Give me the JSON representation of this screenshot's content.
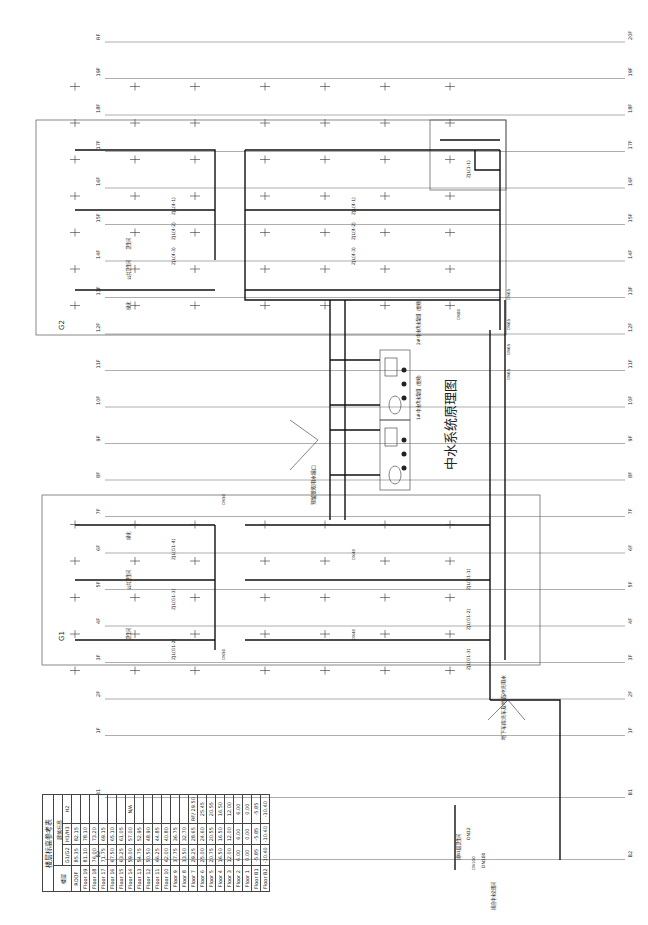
{
  "drawing": {
    "title": "中水系统原理图",
    "orientation": "rotated 90° (sheet drawn sideways)"
  },
  "floors_left": [
    "RF",
    "19F",
    "18F",
    "17F",
    "16F",
    "15F",
    "14F",
    "13F",
    "12F",
    "11F",
    "10F",
    "9F",
    "8F",
    "7F",
    "6F",
    "5F",
    "4F",
    "3F",
    "2F",
    "1F",
    "B1",
    "B2"
  ],
  "floors_right": [
    "20F",
    "19F",
    "18F",
    "17F",
    "16F",
    "15F",
    "14F",
    "13F",
    "12F",
    "11F",
    "10F",
    "9F",
    "8F",
    "7F",
    "6F",
    "5F",
    "4F",
    "3F",
    "2F",
    "1F",
    "B1",
    "B2"
  ],
  "zones": {
    "g1": "G1",
    "g2": "G2"
  },
  "riser_labels": {
    "g1_upper": [
      "ZJL(G1-4)",
      "ZJL(G1-3)",
      "ZJL(G1-2)"
    ],
    "g1_lower": [
      "ZJL(G1-1)",
      "ZJL(G1-2)",
      "ZJL(G1-3)"
    ],
    "g2_upper": [
      "ZJL(4-1)",
      "ZJL(4-2)",
      "ZJL(4-3)"
    ],
    "g2_lower": [
      "ZJL(4-1)",
      "ZJL(4-2)",
      "ZJL(4-3)"
    ],
    "b1": [
      "ZJL(1-1)"
    ]
  },
  "fixture_labels": {
    "g1": [
      "卫生间",
      "公共卫生间",
      "绿化"
    ],
    "g2": [
      "卫生间",
      "公共卫生间",
      "绿化"
    ]
  },
  "pipe_sizes": [
    "DN65",
    "DN65",
    "DN65",
    "DN65",
    "DN50",
    "DN50",
    "DN40",
    "DN40",
    "DN100",
    "DN80"
  ],
  "annotations": {
    "reserved_outlet": "预留景观用水接口",
    "basement_note": "地下车库洗车及地面冲洗用水",
    "b1_supply": "接B1层卫生间",
    "source": "接自中水处理间",
    "source_size": "DN100",
    "b1_size": "DN32"
  },
  "pump_sets": [
    {
      "label": "1#中水供水泵组（变频）"
    },
    {
      "label": "2#中水供水泵组（变频）"
    }
  ],
  "level_table": {
    "title": "楼层标高参考表",
    "headers": {
      "floor": "楼层",
      "level": "建筑标高",
      "g1g2": "G1/G2",
      "h1h3": "H1/H3",
      "h2": "H2"
    },
    "rows": [
      {
        "floor": "ROOF",
        "g": "85.35",
        "h13": "82.15",
        "h2": ""
      },
      {
        "floor": "Floor 19",
        "g": "81.10",
        "h13": "78.10",
        "h2": ""
      },
      {
        "floor": "Floor 18",
        "g": "76.00",
        "h13": "73.20",
        "h2": ""
      },
      {
        "floor": "Floor 17",
        "g": "71.75",
        "h13": "69.15",
        "h2": ""
      },
      {
        "floor": "Floor 16",
        "g": "67.50",
        "h13": "65.10",
        "h2": ""
      },
      {
        "floor": "Floor 15",
        "g": "63.25",
        "h13": "61.05",
        "h2": ""
      },
      {
        "floor": "Floor 14",
        "g": "59.00",
        "h13": "57.00",
        "h2": "N/A"
      },
      {
        "floor": "Floor 13",
        "g": "54.75",
        "h13": "52.95",
        "h2": ""
      },
      {
        "floor": "Floor 12",
        "g": "50.50",
        "h13": "48.90",
        "h2": ""
      },
      {
        "floor": "Floor 11",
        "g": "46.25",
        "h13": "44.85",
        "h2": ""
      },
      {
        "floor": "Floor 10",
        "g": "42.00",
        "h13": "40.80",
        "h2": ""
      },
      {
        "floor": "Floor 9",
        "g": "37.75",
        "h13": "36.75",
        "h2": ""
      },
      {
        "floor": "Floor 8",
        "g": "33.50",
        "h13": "32.70",
        "h2": ""
      },
      {
        "floor": "Floor 7",
        "g": "29.25",
        "h13": "28.65",
        "h2": "RF/ 29.50"
      },
      {
        "floor": "Floor 6",
        "g": "25.00",
        "h13": "24.60",
        "h2": "25.45"
      },
      {
        "floor": "Floor 5",
        "g": "20.75",
        "h13": "20.55",
        "h2": "20.55"
      },
      {
        "floor": "Floor 4",
        "g": "16.50",
        "h13": "16.50",
        "h2": "16.50"
      },
      {
        "floor": "Floor 3",
        "g": "12.00",
        "h13": "12.00",
        "h2": "12.00"
      },
      {
        "floor": "Floor 2",
        "g": "6.00",
        "h13": "6.00",
        "h2": "6.00"
      },
      {
        "floor": "Floor 1",
        "g": "0.00",
        "h13": "0.00",
        "h2": "0.00"
      },
      {
        "floor": "Floor B1",
        "g": "-5.85",
        "h13": "-5.85",
        "h2": "-5.85"
      },
      {
        "floor": "Floor B2",
        "g": "-10.40",
        "h13": "-10.40",
        "h2": "-10.40"
      }
    ]
  },
  "colors": {
    "background": "#ffffff",
    "pipe": "#111111",
    "grid": "#777777",
    "text": "#222222"
  }
}
